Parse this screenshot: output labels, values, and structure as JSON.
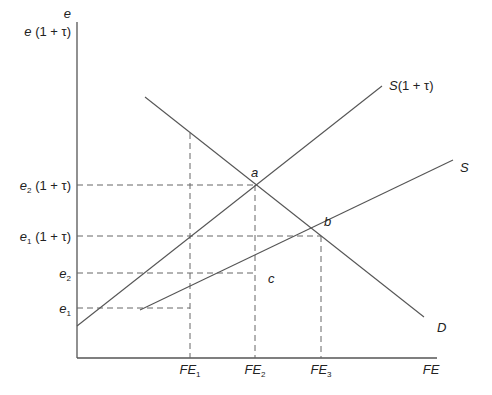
{
  "diagram": {
    "type": "supply-demand",
    "axes": {
      "y_label_top": "e",
      "y_label_second": "e (1 + τ)",
      "x_label": "FE"
    },
    "y_ticks": [
      {
        "base": "e",
        "sub": "2",
        "suffix": " (1 + τ)",
        "level": "e2(1+τ)"
      },
      {
        "base": "e",
        "sub": "1",
        "suffix": " (1 + τ)",
        "level": "e1(1+τ)"
      },
      {
        "base": "e",
        "sub": "2",
        "suffix": "",
        "level": "e2"
      },
      {
        "base": "e",
        "sub": "1",
        "suffix": "",
        "level": "e1"
      }
    ],
    "x_ticks": [
      {
        "base": "FE",
        "sub": "1"
      },
      {
        "base": "FE",
        "sub": "2"
      },
      {
        "base": "FE",
        "sub": "3"
      }
    ],
    "curves": {
      "demand": "D",
      "supply": "S",
      "supply_taxed": "S(1 + τ)"
    },
    "points": {
      "a": "a",
      "b": "b",
      "c": "c"
    },
    "colors": {
      "line": "#555555",
      "text": "#222222",
      "background": "#ffffff"
    }
  }
}
